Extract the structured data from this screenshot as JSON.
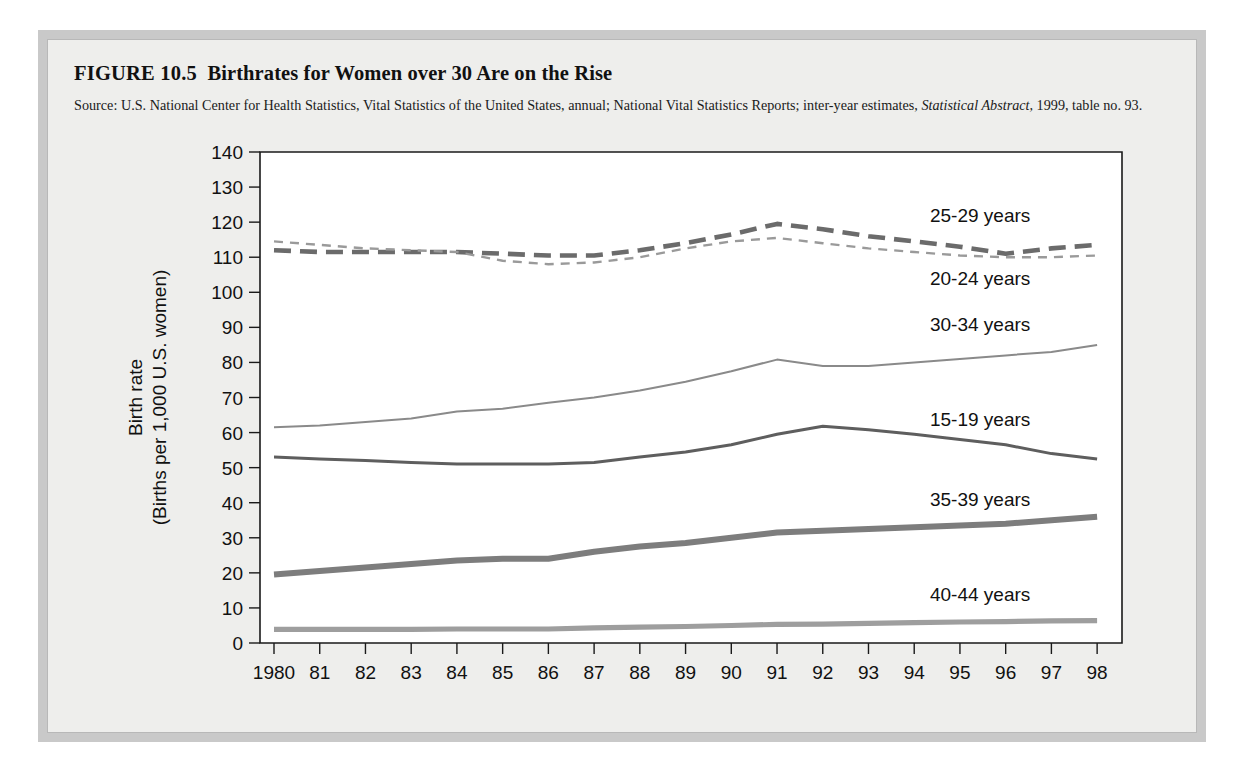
{
  "figure": {
    "number": "FIGURE 10.5",
    "title": "Birthrates for Women over 30 Are on the Rise",
    "source_prefix": "Source: U.S. National Center for Health Statistics, Vital Statistics of the United States, annual; National Vital Statistics Reports; inter-year estimates, ",
    "source_italic": "Statistical Abstract,",
    "source_suffix": " 1999, table no. 93."
  },
  "colors": {
    "card_border": "#c9c9c9",
    "page_bg": "#eeeeec",
    "plot_bg": "#ffffff",
    "axis": "#1a1a1a",
    "series_25_29": "#6b6b6b",
    "series_20_24": "#9a9a9a",
    "series_30_34": "#8a8a8a",
    "series_15_19": "#5e5e5e",
    "series_35_39": "#7d7d7d",
    "series_40_44": "#9e9e9e"
  },
  "chart_data": {
    "type": "line",
    "title": "Birthrates for Women over 30 Are on the Rise",
    "xlabel": "",
    "ylabel": "Birth rate (Births per 1,000 U.S. women)",
    "ylabel_line1": "Birth rate",
    "ylabel_line2": "(Births per 1,000 U.S. women)",
    "ylim": [
      0,
      140
    ],
    "yticks": [
      0,
      10,
      20,
      30,
      40,
      50,
      60,
      70,
      80,
      90,
      100,
      110,
      120,
      130,
      140
    ],
    "ytick_labels": [
      "0",
      "10",
      "20",
      "30",
      "40",
      "50",
      "60",
      "70",
      "80",
      "90",
      "100",
      "110",
      "120",
      "130",
      "140"
    ],
    "grid": false,
    "legend_position": "inline-right",
    "x": [
      1980,
      1981,
      1982,
      1983,
      1984,
      1985,
      1986,
      1987,
      1988,
      1989,
      1990,
      1991,
      1992,
      1993,
      1994,
      1995,
      1996,
      1997,
      1998
    ],
    "xtick_labels": [
      "1980",
      "81",
      "82",
      "83",
      "84",
      "85",
      "86",
      "87",
      "88",
      "89",
      "90",
      "91",
      "92",
      "93",
      "94",
      "95",
      "96",
      "97",
      "98"
    ],
    "series": [
      {
        "name": "25-29 years",
        "style": "dashed-bold",
        "values": [
          112.0,
          111.5,
          111.5,
          111.5,
          111.5,
          111.0,
          110.5,
          110.5,
          112.0,
          114.0,
          116.5,
          119.5,
          118.0,
          116.0,
          114.5,
          113.0,
          111.0,
          112.5,
          113.5
        ]
      },
      {
        "name": "20-24 years",
        "style": "dotted",
        "values": [
          114.5,
          113.5,
          112.5,
          112.0,
          111.5,
          109.0,
          108.0,
          108.5,
          110.0,
          112.5,
          114.5,
          115.5,
          114.0,
          112.5,
          111.5,
          110.5,
          110.0,
          110.0,
          110.5
        ]
      },
      {
        "name": "30-34 years",
        "style": "thin",
        "values": [
          61.5,
          62.0,
          63.0,
          64.0,
          66.0,
          66.8,
          68.5,
          70.0,
          72.0,
          74.5,
          77.5,
          80.8,
          79.0,
          79.0,
          80.0,
          81.0,
          82.0,
          83.0,
          85.0
        ]
      },
      {
        "name": "15-19 years",
        "style": "medium",
        "values": [
          53.0,
          52.5,
          52.0,
          51.5,
          51.0,
          51.0,
          51.0,
          51.5,
          53.0,
          54.5,
          56.5,
          59.5,
          61.8,
          60.8,
          59.5,
          58.0,
          56.5,
          54.0,
          52.5
        ]
      },
      {
        "name": "35-39 years",
        "style": "thick",
        "values": [
          19.5,
          20.5,
          21.5,
          22.5,
          23.5,
          24.0,
          24.0,
          26.0,
          27.5,
          28.5,
          30.0,
          31.5,
          32.0,
          32.5,
          33.0,
          33.5,
          34.0,
          35.0,
          36.0
        ]
      },
      {
        "name": "40-44 years",
        "style": "thick-light",
        "values": [
          3.9,
          3.9,
          3.9,
          3.9,
          4.0,
          4.0,
          4.0,
          4.3,
          4.5,
          4.7,
          5.0,
          5.3,
          5.4,
          5.6,
          5.8,
          6.0,
          6.1,
          6.3,
          6.4
        ]
      }
    ],
    "inline_labels": [
      {
        "text": "25-29 years",
        "value": 122,
        "year": 1995
      },
      {
        "text": "20-24 years",
        "value": 104,
        "year": 1995
      },
      {
        "text": "30-34 years",
        "value": 91,
        "year": 1995
      },
      {
        "text": "15-19 years",
        "value": 64,
        "year": 1995
      },
      {
        "text": "35-39 years",
        "value": 41,
        "year": 1995
      },
      {
        "text": "40-44 years",
        "value": 14,
        "year": 1995
      }
    ]
  }
}
